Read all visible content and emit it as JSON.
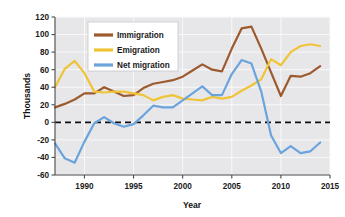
{
  "chart_data": {
    "type": "line",
    "title": "",
    "xlabel": "Year",
    "ylabel": "Thousands",
    "xlim": [
      1987,
      2015
    ],
    "ylim": [
      -60,
      120
    ],
    "xticks": [
      1990,
      1995,
      2000,
      2005,
      2010,
      2015
    ],
    "yticks": [
      -60,
      -40,
      -20,
      0,
      20,
      40,
      60,
      80,
      100,
      120
    ],
    "grid": true,
    "legend_position": "upper-left-inside",
    "zero_line": true,
    "x": [
      1987,
      1988,
      1989,
      1990,
      1991,
      1992,
      1993,
      1994,
      1995,
      1996,
      1997,
      1998,
      1999,
      2000,
      2001,
      2002,
      2003,
      2004,
      2005,
      2006,
      2007,
      2008,
      2009,
      2010,
      2011,
      2012,
      2013,
      2014
    ],
    "series": [
      {
        "name": "Immigration",
        "color": "#9C5A2E",
        "values": [
          17,
          21,
          26,
          33,
          33,
          40,
          35,
          30,
          31,
          39,
          44,
          46,
          48,
          52,
          59,
          66,
          60,
          58,
          84,
          107,
          109,
          84,
          57,
          30,
          53,
          52,
          56,
          64
        ]
      },
      {
        "name": "Emigration",
        "color": "#EFC437",
        "values": [
          40,
          61,
          70,
          56,
          35,
          34,
          35,
          35,
          33,
          31,
          25,
          29,
          31,
          27,
          26,
          25,
          29,
          27,
          29,
          36,
          42,
          49,
          72,
          65,
          80,
          87,
          89,
          87
        ]
      },
      {
        "name": "Net migration",
        "color": "#6BA4DD",
        "values": [
          -24,
          -41,
          -46,
          -22,
          -1,
          6,
          -1,
          -5,
          -2,
          8,
          19,
          17,
          17,
          25,
          33,
          41,
          31,
          31,
          55,
          71,
          67,
          35,
          -15,
          -35,
          -27,
          -35,
          -33,
          -23
        ]
      }
    ]
  },
  "axes": {
    "y_title": "Thousands",
    "x_title": "Year",
    "x_tick_labels": [
      "1990",
      "1995",
      "2000",
      "2005",
      "2010",
      "2015"
    ],
    "y_tick_labels": [
      "120",
      "100",
      "80",
      "60",
      "40",
      "20",
      "0",
      "-20",
      "-40",
      "-60"
    ]
  },
  "legend": {
    "items": [
      {
        "label": "Immigration",
        "color": "#9C5A2E"
      },
      {
        "label": "Emigration",
        "color": "#EFC437"
      },
      {
        "label": "Net migration",
        "color": "#6BA4DD"
      }
    ]
  },
  "colors": {
    "plot_background": "#E7E7EA",
    "gridline": "#FAFAFA",
    "axis": "#4A4A4A",
    "zero_line": "#111111",
    "page_background": "#FFFFFF"
  }
}
